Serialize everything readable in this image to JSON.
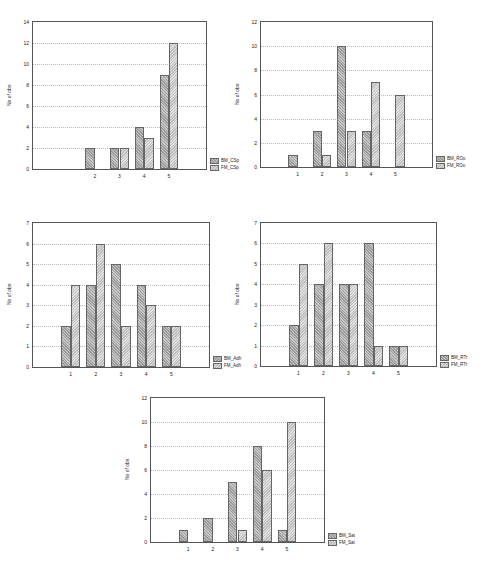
{
  "chart_data": [
    {
      "type": "bar",
      "ylabel": "No of obs",
      "xlabel": "",
      "categories": [
        "1",
        "2",
        "3",
        "4",
        "5"
      ],
      "x_tick_labels": [
        "2",
        "3",
        "4",
        "5"
      ],
      "ylim": [
        0,
        14
      ],
      "yticks": [
        0,
        2,
        4,
        6,
        8,
        10,
        12,
        14
      ],
      "grid": true,
      "legend_position": "right-bottom",
      "series": [
        {
          "name": "BM_CSp",
          "values": [
            0,
            2,
            2,
            4,
            9
          ]
        },
        {
          "name": "FM_CSp",
          "values": [
            0,
            0,
            2,
            3,
            12
          ]
        }
      ]
    },
    {
      "type": "bar",
      "ylabel": "No of obs",
      "xlabel": "",
      "categories": [
        "1",
        "2",
        "3",
        "4",
        "5"
      ],
      "x_tick_labels": [
        "1",
        "2",
        "3",
        "4",
        "5"
      ],
      "ylim": [
        0,
        12
      ],
      "yticks": [
        0,
        2,
        4,
        6,
        8,
        10,
        12
      ],
      "grid": true,
      "legend_position": "right-bottom",
      "series": [
        {
          "name": "BM_ROo",
          "values": [
            1,
            3,
            10,
            3,
            0
          ]
        },
        {
          "name": "FM_ROo",
          "values": [
            0,
            1,
            3,
            7,
            6
          ]
        }
      ]
    },
    {
      "type": "bar",
      "ylabel": "No of obs",
      "xlabel": "",
      "categories": [
        "1",
        "2",
        "3",
        "4",
        "5"
      ],
      "x_tick_labels": [
        "1",
        "2",
        "3",
        "4",
        "5"
      ],
      "ylim": [
        0,
        7
      ],
      "yticks": [
        0,
        1,
        2,
        3,
        4,
        5,
        6,
        7
      ],
      "grid": true,
      "legend_position": "right-bottom",
      "series": [
        {
          "name": "BM_Adh",
          "values": [
            2,
            4,
            5,
            4,
            2
          ]
        },
        {
          "name": "FM_Adh",
          "values": [
            4,
            6,
            2,
            3,
            2
          ]
        }
      ]
    },
    {
      "type": "bar",
      "ylabel": "No of obs",
      "xlabel": "",
      "categories": [
        "1",
        "2",
        "3",
        "4",
        "5"
      ],
      "x_tick_labels": [
        "1",
        "2",
        "3",
        "4",
        "5"
      ],
      "ylim": [
        0,
        7
      ],
      "yticks": [
        0,
        1,
        2,
        3,
        4,
        5,
        6,
        7
      ],
      "grid": true,
      "legend_position": "right-bottom",
      "series": [
        {
          "name": "BM_RTr",
          "values": [
            2,
            4,
            4,
            6,
            1
          ]
        },
        {
          "name": "FM_RTr",
          "values": [
            5,
            6,
            4,
            1,
            1
          ]
        }
      ]
    },
    {
      "type": "bar",
      "ylabel": "No of obs",
      "xlabel": "",
      "categories": [
        "1",
        "2",
        "3",
        "4",
        "5"
      ],
      "x_tick_labels": [
        "1",
        "2",
        "3",
        "4",
        "5"
      ],
      "ylim": [
        0,
        12
      ],
      "yticks": [
        0,
        2,
        4,
        6,
        8,
        10,
        12
      ],
      "grid": true,
      "legend_position": "right-bottom",
      "series": [
        {
          "name": "BM_Sat",
          "values": [
            1,
            2,
            5,
            8,
            1
          ]
        },
        {
          "name": "FM_Sat",
          "values": [
            0,
            0,
            1,
            6,
            10
          ]
        }
      ]
    }
  ],
  "layout": [
    {
      "left": 32,
      "top": 21,
      "width": 175,
      "height": 149,
      "legend_left": 210,
      "legend_top": 157
    },
    {
      "left": 260,
      "top": 21,
      "width": 173,
      "height": 147,
      "legend_left": 436,
      "legend_top": 155
    },
    {
      "left": 32,
      "top": 222,
      "width": 178,
      "height": 146,
      "legend_left": 213,
      "legend_top": 355
    },
    {
      "left": 260,
      "top": 222,
      "width": 177,
      "height": 145,
      "legend_left": 440,
      "legend_top": 354
    },
    {
      "left": 150,
      "top": 397,
      "width": 175,
      "height": 146,
      "legend_left": 328,
      "legend_top": 532
    }
  ],
  "colors": {
    "bm": "#a8a8a8",
    "fm": "#d0d0d0",
    "axis": "#555555"
  }
}
